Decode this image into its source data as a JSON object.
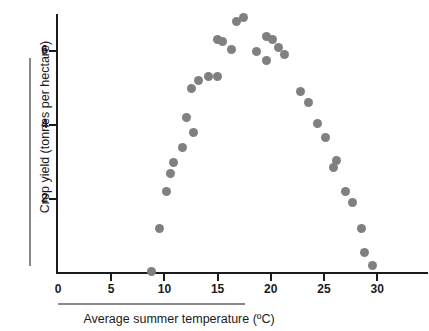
{
  "chart_data": {
    "type": "scatter",
    "title": "",
    "xlabel": "Average summer temperature (ºC)",
    "ylabel": "Crop yield (tonnes per hectare)",
    "xlim": [
      0,
      33
    ],
    "ylim": [
      0,
      7.1
    ],
    "xticks": [
      0,
      5,
      10,
      15,
      20,
      25,
      30
    ],
    "xticklabels": [
      "0",
      "5",
      "10",
      "15",
      "20",
      "25",
      "30"
    ],
    "yticks": [
      2,
      4,
      6
    ],
    "yticklabels": [
      "2",
      "4",
      "6"
    ],
    "grid": false,
    "legend": null,
    "marker": {
      "shape": "circle",
      "color": "#808080",
      "size_px": 9
    },
    "axis_color": "#1b1b1b",
    "series": [
      {
        "name": "Crop yield vs temperature",
        "points": [
          {
            "x": 8.8,
            "y": 0.05
          },
          {
            "x": 9.5,
            "y": 1.2
          },
          {
            "x": 10.2,
            "y": 2.2
          },
          {
            "x": 10.6,
            "y": 2.7
          },
          {
            "x": 10.9,
            "y": 3.0
          },
          {
            "x": 11.7,
            "y": 3.4
          },
          {
            "x": 12.1,
            "y": 4.2
          },
          {
            "x": 12.7,
            "y": 3.8
          },
          {
            "x": 12.5,
            "y": 5.0
          },
          {
            "x": 13.2,
            "y": 5.2
          },
          {
            "x": 14.1,
            "y": 5.3
          },
          {
            "x": 15.0,
            "y": 5.3
          },
          {
            "x": 15.0,
            "y": 6.3
          },
          {
            "x": 15.5,
            "y": 6.25
          },
          {
            "x": 16.3,
            "y": 6.05
          },
          {
            "x": 16.8,
            "y": 6.8
          },
          {
            "x": 17.4,
            "y": 6.9
          },
          {
            "x": 18.7,
            "y": 6.0
          },
          {
            "x": 19.6,
            "y": 6.4
          },
          {
            "x": 19.6,
            "y": 5.75
          },
          {
            "x": 20.2,
            "y": 6.3
          },
          {
            "x": 20.7,
            "y": 6.1
          },
          {
            "x": 21.3,
            "y": 5.9
          },
          {
            "x": 22.8,
            "y": 4.9
          },
          {
            "x": 23.5,
            "y": 4.6
          },
          {
            "x": 24.4,
            "y": 4.05
          },
          {
            "x": 25.1,
            "y": 3.65
          },
          {
            "x": 25.9,
            "y": 2.85
          },
          {
            "x": 26.2,
            "y": 3.05
          },
          {
            "x": 27.0,
            "y": 2.2
          },
          {
            "x": 27.7,
            "y": 1.9
          },
          {
            "x": 28.5,
            "y": 1.2
          },
          {
            "x": 28.8,
            "y": 0.55
          },
          {
            "x": 29.6,
            "y": 0.2
          }
        ]
      }
    ]
  },
  "axes": {
    "x_title": "Average summer temperature (ºC)",
    "y_title": "Crop yield (tonnes per hectare)"
  }
}
